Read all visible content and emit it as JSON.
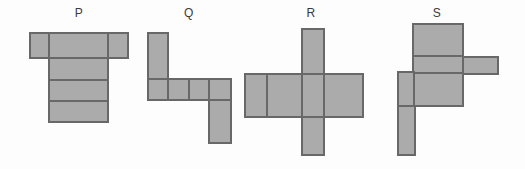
{
  "figure": {
    "description_labels": [
      "P",
      "Q",
      "R",
      "S"
    ],
    "colors": {
      "background": "#fdfdfd",
      "shape_fill": "#ababab",
      "shape_border": "#686868",
      "label_color": "#3b3b3b"
    },
    "shapes": [
      {
        "label": "P",
        "label_cx": 79,
        "label_y": 7,
        "rects": [
          {
            "x": 30,
            "y": 33,
            "w": 19,
            "h": 25
          },
          {
            "x": 49,
            "y": 33,
            "w": 59,
            "h": 25
          },
          {
            "x": 108,
            "y": 33,
            "w": 20,
            "h": 25
          },
          {
            "x": 49,
            "y": 58,
            "w": 59,
            "h": 22
          },
          {
            "x": 49,
            "y": 80,
            "w": 59,
            "h": 21
          },
          {
            "x": 49,
            "y": 101,
            "w": 59,
            "h": 21
          }
        ]
      },
      {
        "label": "Q",
        "label_cx": 189,
        "label_y": 7,
        "rects": [
          {
            "x": 148,
            "y": 33,
            "w": 20,
            "h": 46
          },
          {
            "x": 148,
            "y": 79,
            "w": 20,
            "h": 21
          },
          {
            "x": 168,
            "y": 79,
            "w": 21,
            "h": 21
          },
          {
            "x": 189,
            "y": 79,
            "w": 20,
            "h": 21
          },
          {
            "x": 209,
            "y": 79,
            "w": 22,
            "h": 21
          },
          {
            "x": 209,
            "y": 100,
            "w": 22,
            "h": 43
          }
        ]
      },
      {
        "label": "R",
        "label_cx": 311,
        "label_y": 7,
        "rects": [
          {
            "x": 302,
            "y": 29,
            "w": 22,
            "h": 45
          },
          {
            "x": 245,
            "y": 74,
            "w": 22,
            "h": 43
          },
          {
            "x": 267,
            "y": 74,
            "w": 35,
            "h": 43
          },
          {
            "x": 302,
            "y": 74,
            "w": 22,
            "h": 43
          },
          {
            "x": 324,
            "y": 74,
            "w": 39,
            "h": 43
          },
          {
            "x": 302,
            "y": 117,
            "w": 22,
            "h": 38
          }
        ]
      },
      {
        "label": "S",
        "label_cx": 437,
        "label_y": 7,
        "rects": [
          {
            "x": 413,
            "y": 24,
            "w": 50,
            "h": 32
          },
          {
            "x": 413,
            "y": 56,
            "w": 50,
            "h": 17
          },
          {
            "x": 463,
            "y": 57,
            "w": 35,
            "h": 17
          },
          {
            "x": 413,
            "y": 73,
            "w": 50,
            "h": 33
          },
          {
            "x": 398,
            "y": 72,
            "w": 16,
            "h": 34
          },
          {
            "x": 398,
            "y": 106,
            "w": 17,
            "h": 49
          }
        ]
      }
    ]
  }
}
